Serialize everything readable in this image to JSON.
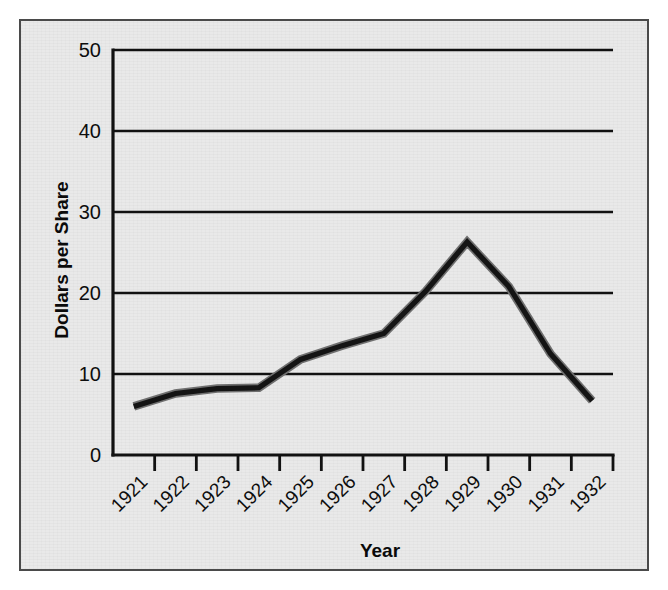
{
  "chart_data": {
    "type": "line",
    "title": "",
    "xlabel": "Year",
    "ylabel": "Dollars per Share",
    "categories": [
      "1921",
      "1922",
      "1923",
      "1924",
      "1925",
      "1926",
      "1927",
      "1928",
      "1929",
      "1930",
      "1931",
      "1932"
    ],
    "values": [
      6.0,
      7.6,
      8.2,
      8.3,
      11.8,
      13.5,
      15.0,
      20.2,
      26.3,
      20.8,
      12.5,
      6.7
    ],
    "series": [
      {
        "name": "Dollars per Share",
        "values": [
          6.0,
          7.6,
          8.2,
          8.3,
          11.8,
          13.5,
          15.0,
          20.2,
          26.3,
          20.8,
          12.5,
          6.7
        ]
      }
    ],
    "x_tick_labels": [
      "1921",
      "1922",
      "1923",
      "1924",
      "1925",
      "1926",
      "1927",
      "1928",
      "1929",
      "1930",
      "1931",
      "1932"
    ],
    "y_tick_labels": [
      "0",
      "10",
      "20",
      "30",
      "40",
      "50"
    ],
    "y_tick_values": [
      0,
      10,
      20,
      30,
      40,
      50
    ],
    "ylim": [
      0,
      50
    ],
    "grid": "horizontal",
    "legend": "none",
    "line_color": "#141414",
    "background_color": "#e9e9e9",
    "axis_color": "#111111",
    "xtick_label_rotation": -45
  },
  "figure": {
    "border_color": "#4a4a4a",
    "plot_background": "#e9e9e9"
  }
}
